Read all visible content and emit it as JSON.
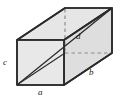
{
  "figure": {
    "kind": "geometry-diagram",
    "shape": "rectangular-box",
    "title": "",
    "canvas": {
      "width": 125,
      "height": 102
    },
    "colors": {
      "background": "#ffffff",
      "face_fill": "#e8e8e8",
      "top_fill": "#e4e4e4",
      "side_fill": "#dedede",
      "edge": "#2b2b2b",
      "hidden_edge": "#8a8a8a",
      "diagonal": "#2b2b2b",
      "label": "#1a1a1a"
    },
    "vertices": {
      "front_top_left": [
        17,
        40
      ],
      "front_top_right": [
        64,
        40
      ],
      "front_bottom_right": [
        64,
        85
      ],
      "front_bottom_left": [
        17,
        85
      ],
      "back_top_left": [
        65,
        8
      ],
      "back_top_right": [
        112,
        8
      ],
      "back_bottom_right": [
        112,
        53
      ],
      "back_bottom_left": [
        65,
        53
      ]
    },
    "hidden_edges": [
      {
        "name": "back-left-vertical",
        "from": [
          65,
          8
        ],
        "to": [
          65,
          53
        ]
      },
      {
        "name": "back-bottom-horizontal",
        "from": [
          65,
          53
        ],
        "to": [
          112,
          53
        ]
      }
    ],
    "diagonals": [
      {
        "name": "space-diagonal",
        "from": [
          17,
          85
        ],
        "to": [
          112,
          8
        ],
        "label": "d",
        "style": "solid"
      },
      {
        "name": "base-diagonal",
        "from": [
          17,
          85
        ],
        "to": [
          65,
          53
        ],
        "label": "",
        "style": "solid"
      }
    ],
    "labels": [
      {
        "id": "c",
        "text": "c",
        "edge": "front-left-vertical-height",
        "x": 3,
        "y": 58
      },
      {
        "id": "a",
        "text": "a",
        "edge": "front-bottom-width",
        "x": 38,
        "y": 88
      },
      {
        "id": "b",
        "text": "b",
        "edge": "bottom-right-depth",
        "x": 89,
        "y": 68
      },
      {
        "id": "d",
        "text": "d",
        "edge": "space-diagonal",
        "x": 76,
        "y": 32
      }
    ]
  }
}
